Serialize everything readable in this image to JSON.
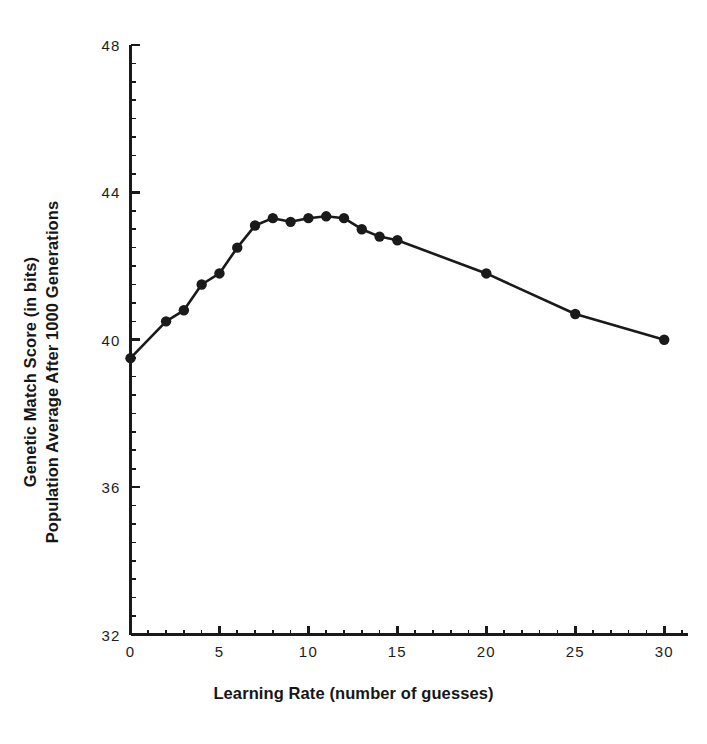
{
  "chart_data": {
    "type": "line",
    "title": "",
    "xlabel": "Learning Rate (number of guesses)",
    "ylabel_line1": "Genetic Match Score (in bits)",
    "ylabel_line2": "Population Average After 1000 Generations",
    "xlim": [
      0,
      31
    ],
    "ylim": [
      32,
      48
    ],
    "xticks": [
      0,
      5,
      10,
      15,
      20,
      25,
      30
    ],
    "xtick_labels": [
      "0",
      "5",
      "10",
      "15",
      "20",
      "25",
      "30"
    ],
    "yticks": [
      32,
      36,
      40,
      44,
      48
    ],
    "ytick_labels": [
      "32",
      "36",
      "40",
      "44",
      "48"
    ],
    "x_minor_tick_step": 1,
    "y_minor_tick_step": 0.5,
    "grid": false,
    "legend": false,
    "marker": "filled-circle",
    "line_color": "#1a1a1a",
    "marker_color": "#1a1a1a",
    "axis_color": "#1a1a1a",
    "background_color": "#ffffff",
    "x": [
      0,
      2,
      3,
      4,
      5,
      6,
      7,
      8,
      9,
      10,
      11,
      12,
      13,
      14,
      15,
      20,
      25,
      30
    ],
    "values": [
      39.5,
      40.5,
      40.8,
      41.5,
      41.8,
      42.5,
      43.1,
      43.3,
      43.2,
      43.3,
      43.35,
      43.3,
      43.0,
      42.8,
      42.7,
      41.8,
      40.7,
      40.0
    ],
    "series": [
      {
        "name": "Population Average Genetic Match Score",
        "x": [
          0,
          2,
          3,
          4,
          5,
          6,
          7,
          8,
          9,
          10,
          11,
          12,
          13,
          14,
          15,
          20,
          25,
          30
        ],
        "values": [
          39.5,
          40.5,
          40.8,
          41.5,
          41.8,
          42.5,
          43.1,
          43.3,
          43.2,
          43.3,
          43.35,
          43.3,
          43.0,
          42.8,
          42.7,
          41.8,
          40.7,
          40.0
        ]
      }
    ]
  }
}
